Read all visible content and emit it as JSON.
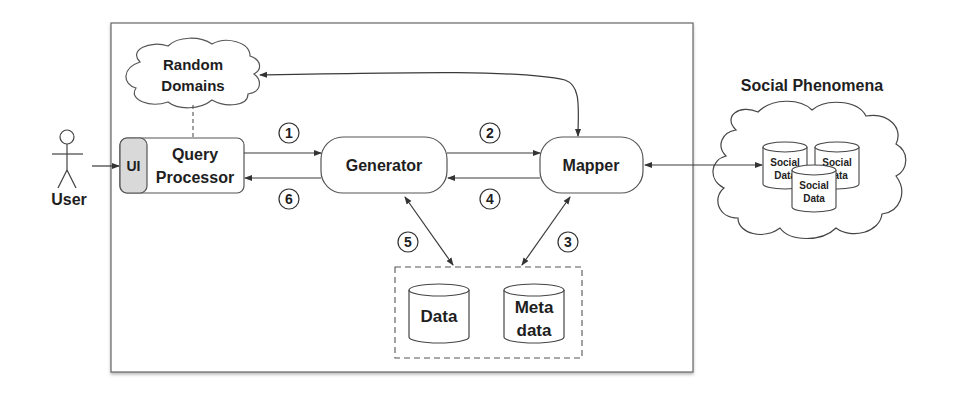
{
  "diagram": {
    "actor": {
      "label": "User"
    },
    "random_domains": {
      "line1": "Random",
      "line2": "Domains"
    },
    "ui": {
      "label": "UI",
      "fill": "#d9d9d9"
    },
    "query_processor": {
      "line1": "Query",
      "line2": "Processor"
    },
    "generator": {
      "label": "Generator"
    },
    "mapper": {
      "label": "Mapper"
    },
    "storage": {
      "data": {
        "label": "Data"
      },
      "metadata": {
        "line1": "Meta",
        "line2": "data"
      }
    },
    "social": {
      "title": "Social Phenomena",
      "cyl1": {
        "line1": "Social",
        "line2": "Data"
      },
      "cyl2": {
        "line1": "Social",
        "line2": "Data"
      },
      "cyl3": {
        "line1": "Social",
        "line2": "Data"
      }
    },
    "steps": [
      "1",
      "2",
      "3",
      "4",
      "5",
      "6"
    ]
  }
}
